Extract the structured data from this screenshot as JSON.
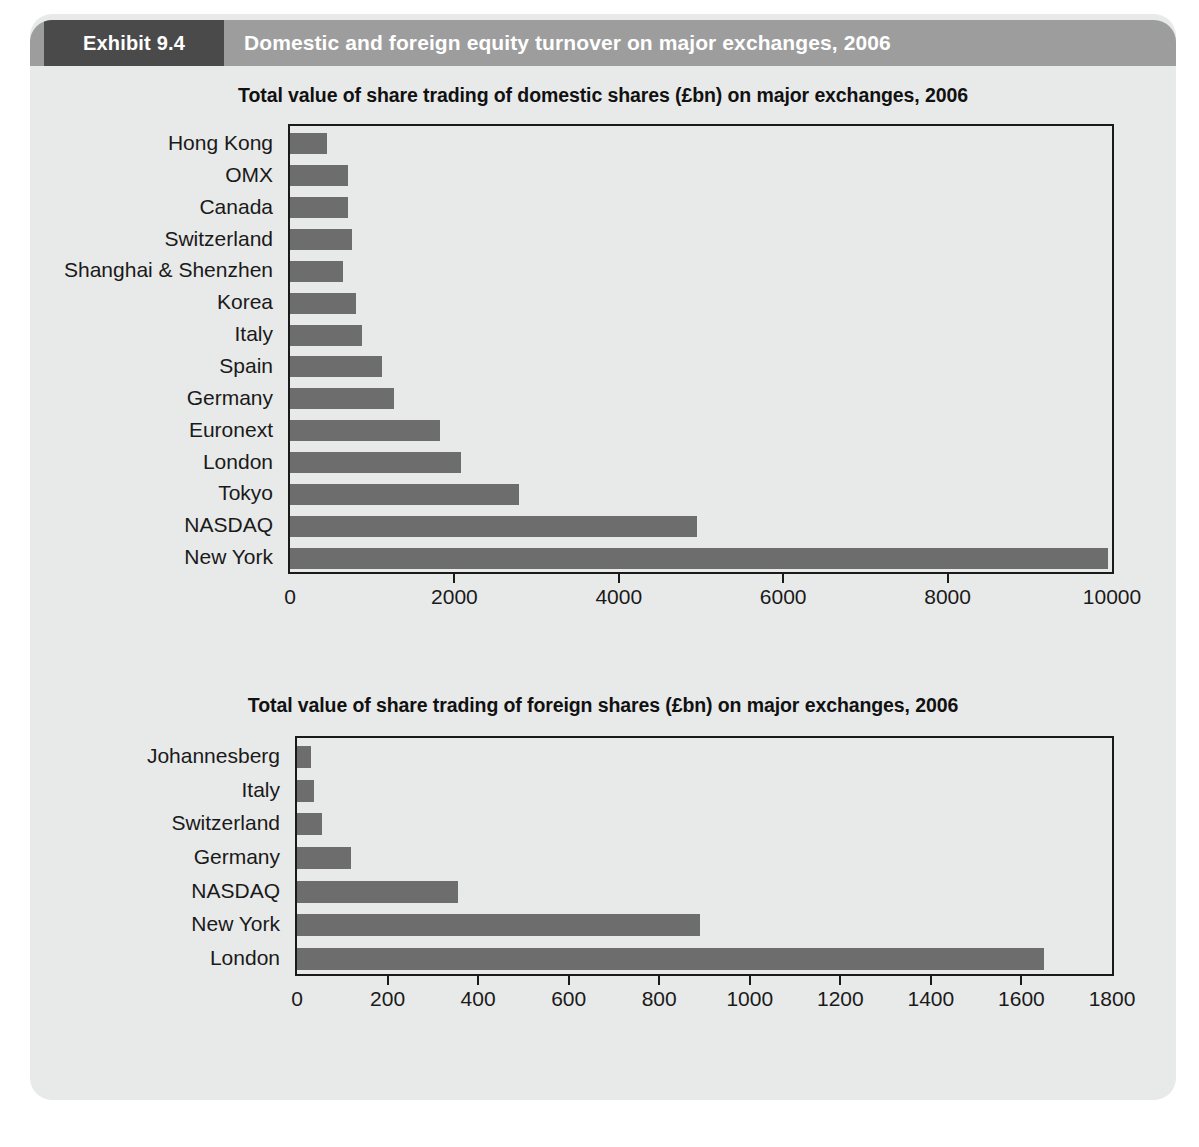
{
  "exhibit": {
    "tag": "Exhibit 9.4",
    "title": "Domestic and foreign equity turnover on major exchanges, 2006"
  },
  "chart_data": [
    {
      "type": "bar",
      "orientation": "horizontal",
      "title": "Total value of share trading of domestic shares (£bn) on major exchanges, 2006",
      "xlabel": "",
      "ylabel": "",
      "xlim": [
        0,
        10000
      ],
      "xticks": [
        0,
        2000,
        4000,
        6000,
        8000,
        10000
      ],
      "xtick_labels": [
        "0",
        "2000",
        "4000",
        "6000",
        "8000",
        "10000"
      ],
      "grid": false,
      "legend": "none",
      "bar_color": "#6d6d6d",
      "categories": [
        "Hong Kong",
        "OMX",
        "Canada",
        "Switzerland",
        "Shanghai & Shenzhen",
        "Korea",
        "Italy",
        "Spain",
        "Germany",
        "Euronext",
        "London",
        "Tokyo",
        "NASDAQ",
        "New York"
      ],
      "values": [
        450,
        700,
        700,
        750,
        640,
        800,
        880,
        1120,
        1260,
        1820,
        2080,
        2780,
        4950,
        9950
      ]
    },
    {
      "type": "bar",
      "orientation": "horizontal",
      "title": "Total value of share trading of foreign shares (£bn) on major exchanges, 2006",
      "xlabel": "",
      "ylabel": "",
      "xlim": [
        0,
        1800
      ],
      "xticks": [
        0,
        200,
        400,
        600,
        800,
        1000,
        1200,
        1400,
        1600,
        1800
      ],
      "xtick_labels": [
        "0",
        "200",
        "400",
        "600",
        "800",
        "1000",
        "1200",
        "1400",
        "1600",
        "1800"
      ],
      "grid": false,
      "legend": "none",
      "bar_color": "#6d6d6d",
      "categories": [
        "Johannesberg",
        "Italy",
        "Switzerland",
        "Germany",
        "NASDAQ",
        "New York",
        "London"
      ],
      "values": [
        30,
        38,
        55,
        120,
        355,
        890,
        1650
      ]
    }
  ],
  "colors": {
    "panel_background": "#e8e9e9",
    "header_bar": "#9d9d9d",
    "header_tag": "#4a4a4a",
    "bar": "#6d6d6d",
    "axis": "#1a1a1a"
  }
}
